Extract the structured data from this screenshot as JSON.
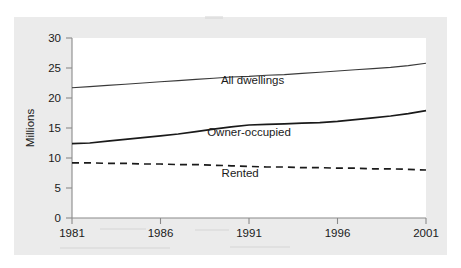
{
  "figure": {
    "background_color": "#ebebeb",
    "plot_background_color": "#ffffff",
    "axis_color": "#8a8a8a"
  },
  "axes": {
    "y_title": "Millions",
    "y_ticks": [
      "0",
      "5",
      "10",
      "15",
      "20",
      "25",
      "30"
    ],
    "x_ticks": [
      "1981",
      "1986",
      "1991",
      "1996",
      "2001"
    ]
  },
  "series_labels": {
    "all_dwellings": "All dwellings",
    "owner_occupied": "Owner-occupied",
    "rented": "Rented"
  },
  "chart_data": {
    "type": "line",
    "title": "",
    "xlabel": "",
    "ylabel": "Millions",
    "xlim": [
      1981,
      2001
    ],
    "ylim": [
      0,
      30
    ],
    "xticks": [
      1981,
      1986,
      1991,
      1996,
      2001
    ],
    "yticks": [
      0,
      5,
      10,
      15,
      20,
      25,
      30
    ],
    "grid": false,
    "legend": "inline-annotations",
    "x": [
      1981,
      1982,
      1983,
      1984,
      1985,
      1986,
      1987,
      1988,
      1989,
      1990,
      1991,
      1992,
      1993,
      1994,
      1995,
      1996,
      1997,
      1998,
      1999,
      2000,
      2001
    ],
    "series": [
      {
        "name": "All dwellings",
        "style": "solid-thin",
        "color": "#3a3a3a",
        "values": [
          21.7,
          21.9,
          22.1,
          22.3,
          22.5,
          22.7,
          22.9,
          23.1,
          23.3,
          23.5,
          23.6,
          23.8,
          23.9,
          24.1,
          24.3,
          24.5,
          24.7,
          24.9,
          25.1,
          25.4,
          25.8
        ]
      },
      {
        "name": "Owner-occupied",
        "style": "solid-thick",
        "color": "#1a1a1a",
        "values": [
          12.4,
          12.5,
          12.8,
          13.1,
          13.4,
          13.7,
          14.0,
          14.4,
          14.8,
          15.2,
          15.5,
          15.6,
          15.7,
          15.8,
          15.9,
          16.1,
          16.4,
          16.7,
          17.0,
          17.4,
          17.9
        ]
      },
      {
        "name": "Rented",
        "style": "dashed",
        "color": "#1a1a1a",
        "values": [
          9.2,
          9.2,
          9.1,
          9.1,
          9.0,
          9.0,
          8.9,
          8.9,
          8.8,
          8.7,
          8.6,
          8.5,
          8.5,
          8.4,
          8.4,
          8.3,
          8.3,
          8.2,
          8.2,
          8.1,
          8.0
        ]
      }
    ],
    "annotations": [
      {
        "text": "All dwellings",
        "x": 1991.2,
        "y": 22.4
      },
      {
        "text": "Owner-occupied",
        "x": 1991.0,
        "y": 13.7
      },
      {
        "text": "Rented",
        "x": 1990.5,
        "y": 6.9
      }
    ]
  }
}
